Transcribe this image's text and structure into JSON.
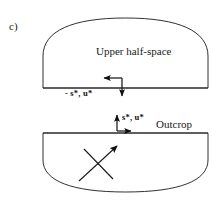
{
  "figure": {
    "panel_label": "c)",
    "upper_region_label": "Upper half-space",
    "outcrop_label": "Outcrop",
    "upper_vector_label": "- s*, u*",
    "lower_vector_label": "s*, u*",
    "stroke_color": "#1a1a1a",
    "arrow_color": "#101010",
    "background_color": "#ffffff"
  },
  "geometry": {
    "upper_dome": {
      "left_x": 43,
      "right_x": 208,
      "baseline_y": 88,
      "apex_y": 18
    },
    "lower_dome": {
      "left_x": 43,
      "right_x": 208,
      "topline_y": 133,
      "bottom_y": 192
    },
    "upper_arrow": {
      "corner_x": 122,
      "corner_y": 78,
      "horizontal_tip_x": 102,
      "vertical_tip_y": 98,
      "direction": "left-and-down"
    },
    "lower_arrow": {
      "corner_x": 117,
      "corner_y": 131,
      "horizontal_tip_x": 133,
      "vertical_tip_y": 113,
      "direction": "right-and-up"
    },
    "slip_cross": {
      "arrow_line": {
        "x1": 79,
        "y1": 181,
        "x2": 119,
        "y2": 144
      },
      "plain_line": {
        "x1": 84,
        "y1": 149,
        "x2": 113,
        "y2": 179
      }
    }
  }
}
